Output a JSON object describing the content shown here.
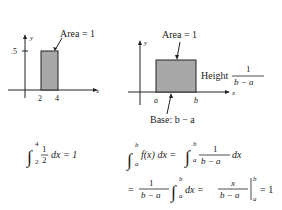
{
  "figures": [
    {
      "id": "left",
      "axis_labels": {
        "x": "x",
        "y": "y"
      },
      "y_tick_label": ".5",
      "x_tick_labels": [
        "2",
        "4"
      ],
      "annotation": "Area = 1"
    },
    {
      "id": "right",
      "axis_labels": {
        "x": "x",
        "y": "y"
      },
      "x_tick_labels": [
        "a",
        "b"
      ],
      "annotation": "Area = 1",
      "height_label": "Height",
      "height_num": "1",
      "height_den": "b − a",
      "base_label": "Base: b − a"
    }
  ],
  "equations": {
    "left": {
      "upper": "4",
      "lower": "2",
      "num": "1",
      "den": "2",
      "rest": "dx = 1"
    },
    "right_line1": {
      "upper1": "b",
      "lower1": "a",
      "lhs": "f(x) dx =",
      "upper2": "b",
      "lower2": "a",
      "num": "1",
      "den": "b − a",
      "rest": "dx"
    },
    "right_line2": {
      "eq": "=",
      "num": "1",
      "den": "b − a",
      "upper": "b",
      "lower": "a",
      "mid": "dx =",
      "num2": "x",
      "den2": "b − a",
      "upper3": "b",
      "lower3": "a",
      "rest": "= 1"
    }
  },
  "colors": {
    "fill": "#a8a8a8",
    "stroke": "#222222"
  }
}
